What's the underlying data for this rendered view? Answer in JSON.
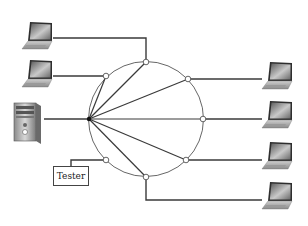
{
  "diagram": {
    "type": "star-ring network topology",
    "hub": {
      "label": "",
      "x": 89,
      "y": 119
    },
    "ring": {
      "cx": 146,
      "cy": 119,
      "r": 57
    },
    "devices": {
      "left": [
        {
          "id": "laptop-left-1",
          "type": "laptop"
        },
        {
          "id": "laptop-left-2",
          "type": "laptop"
        },
        {
          "id": "server",
          "type": "tower-computer"
        }
      ],
      "right": [
        {
          "id": "laptop-right-1",
          "type": "laptop"
        },
        {
          "id": "laptop-right-2",
          "type": "laptop"
        },
        {
          "id": "laptop-right-3",
          "type": "laptop"
        },
        {
          "id": "laptop-right-4",
          "type": "laptop"
        }
      ]
    },
    "tester": {
      "label": "Tester"
    },
    "colors": {
      "line": "#3a3a3a",
      "ring": "#555555",
      "node_fill": "#ffffff"
    }
  }
}
